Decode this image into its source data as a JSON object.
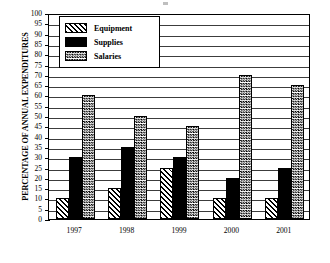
{
  "chart_data": {
    "type": "bar",
    "title": "",
    "xlabel": "",
    "ylabel": "PERCENTAGE OF ANNUAL EXPENDITURES",
    "ylim": [
      0,
      100
    ],
    "ytick_step": 5,
    "yticks": [
      100,
      95,
      90,
      85,
      80,
      75,
      70,
      65,
      60,
      55,
      50,
      45,
      40,
      35,
      30,
      25,
      20,
      15,
      10,
      5,
      0
    ],
    "grid": true,
    "grid_axis": "y",
    "legend_position": "upper-left-inside",
    "categories": [
      "1997",
      "1998",
      "1999",
      "2000",
      "2001"
    ],
    "series": [
      {
        "name": "Equipment",
        "pattern": "diagonal-hatch",
        "values": [
          10,
          15,
          25,
          10,
          10
        ]
      },
      {
        "name": "Supplies",
        "pattern": "solid-black",
        "values": [
          30,
          35,
          30,
          20,
          25
        ]
      },
      {
        "name": "Salaries",
        "pattern": "checkered",
        "values": [
          60,
          50,
          45,
          70,
          65
        ]
      }
    ]
  },
  "legend": {
    "items": [
      {
        "label": "Equipment"
      },
      {
        "label": "Supplies"
      },
      {
        "label": "Salaries"
      }
    ]
  },
  "colors": {
    "ink": "#000000",
    "background": "#ffffff",
    "gridline": "#1a1a1a"
  }
}
